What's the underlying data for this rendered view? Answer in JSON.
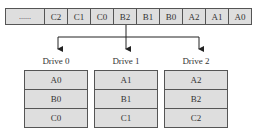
{
  "stream": {
    "cells": [
      "......",
      "C2",
      "C1",
      "C0",
      "B2",
      "B1",
      "B0",
      "A2",
      "A1",
      "A0"
    ]
  },
  "drives": [
    {
      "label": "Drive 0",
      "blocks": [
        "A0",
        "B0",
        "C0"
      ]
    },
    {
      "label": "Drive 1",
      "blocks": [
        "A1",
        "B1",
        "C1"
      ]
    },
    {
      "label": "Drive 2",
      "blocks": [
        "A2",
        "B2",
        "C2"
      ]
    }
  ],
  "colors": {
    "cell_fill": "#dedede",
    "border": "#555555",
    "line": "#222222"
  }
}
